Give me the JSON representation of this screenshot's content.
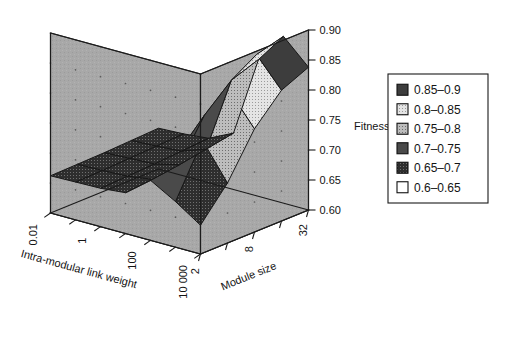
{
  "figure": {
    "background_color": "#ffffff",
    "wall_color": "#a8a8a8",
    "floor_color": "#dcdcdc",
    "frame_color": "#1b1b1b"
  },
  "chart_data": {
    "type": "heatmap",
    "render": "3d-surface",
    "title": "",
    "subtitle": "",
    "xlabel": "Intra-modular link weight",
    "ylabel": "Module size",
    "zlabel": "Fitness",
    "x": [
      0.01,
      0.1,
      1,
      10,
      100,
      1000,
      10000
    ],
    "y": [
      2,
      4,
      8,
      16,
      32
    ],
    "xticks": [
      "0.01",
      "1",
      "100",
      "10 000"
    ],
    "xtick_index": [
      0,
      2,
      4,
      6
    ],
    "yticks": [
      "2",
      "8",
      "32"
    ],
    "ytick_index": [
      0,
      2,
      4
    ],
    "zticks": [
      "0.60",
      "0.65",
      "0.70",
      "0.75",
      "0.80",
      "0.85",
      "0.90"
    ],
    "zlim": [
      0.6,
      0.9
    ],
    "grid": true,
    "legend_position": "right",
    "legend_title": "",
    "z_grid": [
      [
        0.662,
        0.663,
        0.664,
        0.666,
        0.668
      ],
      [
        0.663,
        0.664,
        0.666,
        0.668,
        0.67
      ],
      [
        0.664,
        0.666,
        0.668,
        0.671,
        0.674
      ],
      [
        0.668,
        0.672,
        0.678,
        0.686,
        0.694
      ],
      [
        0.7,
        0.726,
        0.772,
        0.812,
        0.828
      ],
      [
        0.676,
        0.76,
        0.824,
        0.866,
        0.878
      ],
      [
        0.648,
        0.7,
        0.772,
        0.818,
        0.838
      ]
    ],
    "legend": [
      {
        "label": "0.85–0.9",
        "range": [
          0.85,
          0.9
        ],
        "color": "#3d3d3d",
        "pattern": "solid-dark"
      },
      {
        "label": "0.8–0.85",
        "range": [
          0.8,
          0.85
        ],
        "color": "#d2d2d2",
        "pattern": "dotted-light"
      },
      {
        "label": "0.75–0.8",
        "range": [
          0.75,
          0.8
        ],
        "color": "#b0b0b0",
        "pattern": "dotted-mid"
      },
      {
        "label": "0.7–0.75",
        "range": [
          0.7,
          0.75
        ],
        "color": "#4a4a4a",
        "pattern": "solid-dark"
      },
      {
        "label": "0.65–0.7",
        "range": [
          0.65,
          0.7
        ],
        "color": "#2b2b2b",
        "pattern": "speckled-dark"
      },
      {
        "label": "0.6–0.65",
        "range": [
          0.6,
          0.65
        ],
        "color": "#ffffff",
        "pattern": "empty"
      }
    ]
  }
}
